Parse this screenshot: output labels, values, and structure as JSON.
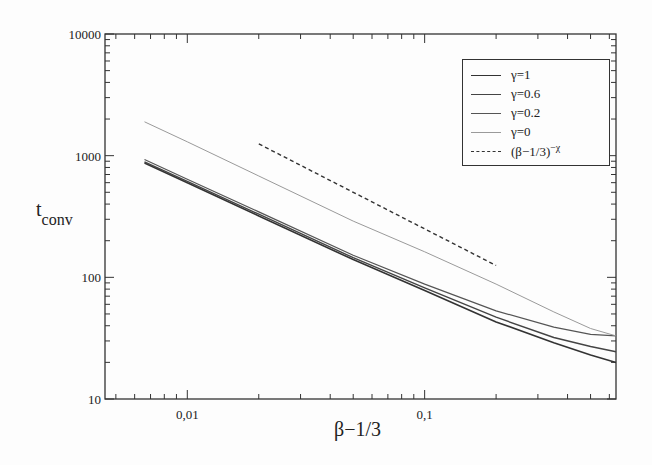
{
  "chart_data": {
    "type": "line",
    "title": "",
    "xlabel": "β−1/3",
    "ylabel": "t",
    "ylabel_sub": "conv",
    "xscale": "log",
    "yscale": "log",
    "xlim": [
      0.0045,
      0.64
    ],
    "ylim": [
      10,
      10000
    ],
    "x_ticks": [
      {
        "value": 0.01,
        "label": "0,01"
      },
      {
        "value": 0.1,
        "label": "0,1"
      }
    ],
    "y_ticks": [
      {
        "value": 10,
        "label": "10"
      },
      {
        "value": 100,
        "label": "100"
      },
      {
        "value": 1000,
        "label": "1000"
      },
      {
        "value": 10000,
        "label": "10000"
      }
    ],
    "grid": false,
    "legend_position": "upper right",
    "series": [
      {
        "name": "γ=1",
        "color": "#333333",
        "dash": "solid",
        "width": 1.6,
        "x": [
          0.0066,
          0.01,
          0.02,
          0.05,
          0.1,
          0.2,
          0.35,
          0.5,
          0.64
        ],
        "y": [
          870,
          600,
          320,
          140,
          78,
          43,
          29,
          23,
          20
        ]
      },
      {
        "name": "γ=0.6",
        "color": "#444444",
        "dash": "solid",
        "width": 1.4,
        "x": [
          0.0066,
          0.01,
          0.02,
          0.05,
          0.1,
          0.2,
          0.35,
          0.5,
          0.64
        ],
        "y": [
          890,
          615,
          330,
          145,
          82,
          47,
          32,
          27,
          24.5
        ]
      },
      {
        "name": "γ=0.2",
        "color": "#555555",
        "dash": "solid",
        "width": 1.2,
        "x": [
          0.0066,
          0.01,
          0.02,
          0.05,
          0.1,
          0.2,
          0.35,
          0.5,
          0.64
        ],
        "y": [
          930,
          640,
          345,
          152,
          88,
          53,
          39,
          34,
          33
        ]
      },
      {
        "name": "γ=0",
        "color": "#9a9a9a",
        "dash": "solid",
        "width": 1.0,
        "x": [
          0.0066,
          0.01,
          0.02,
          0.05,
          0.1,
          0.2,
          0.35,
          0.5,
          0.64
        ],
        "y": [
          1900,
          1300,
          680,
          290,
          162,
          88,
          52,
          38,
          33
        ]
      },
      {
        "name": "(β−1/3)^−χ",
        "color": "#333333",
        "dash": "dashed",
        "width": 1.4,
        "x": [
          0.02,
          0.2
        ],
        "y": [
          1250,
          125
        ]
      }
    ]
  }
}
